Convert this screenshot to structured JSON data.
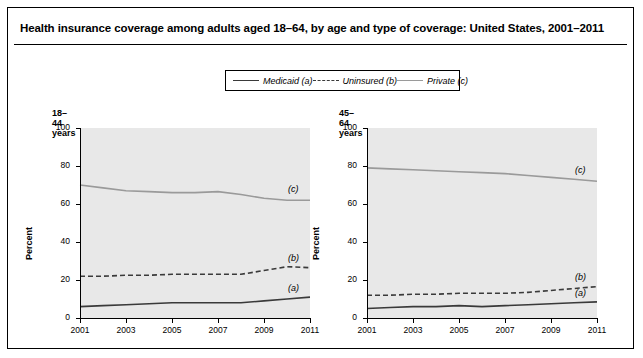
{
  "title": "Health insurance coverage among adults aged 18–64, by age and type of coverage: United States, 2001–2011",
  "legend": {
    "items": [
      {
        "label": "Medicaid (a)",
        "style": "solid-dark",
        "color": "#3a3a3a"
      },
      {
        "label": "Uninsured (b)",
        "style": "dashed-dark",
        "color": "#3a3a3a"
      },
      {
        "label": "Private (c)",
        "style": "solid-grey",
        "color": "#9a9a9a"
      }
    ]
  },
  "chart_data": [
    {
      "type": "line",
      "title": "18–44 years",
      "xlabel": "",
      "ylabel": "Percent",
      "x": [
        2001,
        2002,
        2003,
        2004,
        2005,
        2006,
        2007,
        2008,
        2009,
        2010,
        2011
      ],
      "xticks": [
        "2001",
        "2003",
        "2005",
        "2007",
        "2009",
        "2011"
      ],
      "yticks": [
        "0",
        "20",
        "40",
        "60",
        "80",
        "100"
      ],
      "ylim": [
        0,
        100
      ],
      "xlim": [
        2001,
        2011
      ],
      "grid": false,
      "legend_position": "top-center-shared",
      "series": [
        {
          "name": "Private (c)",
          "annotation": "(c)",
          "values": [
            70,
            68.5,
            67,
            66.5,
            66,
            66,
            66.5,
            65,
            63,
            62,
            62
          ]
        },
        {
          "name": "Uninsured (b)",
          "annotation": "(b)",
          "values": [
            22,
            22,
            22.5,
            22.5,
            23,
            23,
            23,
            23,
            25,
            27,
            26.5
          ]
        },
        {
          "name": "Medicaid (a)",
          "annotation": "(a)",
          "values": [
            6,
            6.5,
            7,
            7.5,
            8,
            8,
            8,
            8,
            9,
            10,
            11
          ]
        }
      ]
    },
    {
      "type": "line",
      "title": "45–64 years",
      "xlabel": "",
      "ylabel": "Percent",
      "x": [
        2001,
        2002,
        2003,
        2004,
        2005,
        2006,
        2007,
        2008,
        2009,
        2010,
        2011
      ],
      "xticks": [
        "2001",
        "2003",
        "2005",
        "2007",
        "2009",
        "2011"
      ],
      "yticks": [
        "0",
        "20",
        "40",
        "60",
        "80",
        "100"
      ],
      "ylim": [
        0,
        100
      ],
      "xlim": [
        2001,
        2011
      ],
      "grid": false,
      "legend_position": "top-center-shared",
      "series": [
        {
          "name": "Private (c)",
          "annotation": "(c)",
          "values": [
            79,
            78.5,
            78,
            77.5,
            77,
            76.5,
            76,
            75,
            74,
            73,
            72
          ]
        },
        {
          "name": "Uninsured (b)",
          "annotation": "(b)",
          "values": [
            12,
            12,
            12.5,
            12.5,
            13,
            13,
            13,
            13.5,
            14.5,
            15.5,
            16.5
          ]
        },
        {
          "name": "Medicaid (a)",
          "annotation": "(a)",
          "values": [
            5,
            5.5,
            6,
            6,
            6.5,
            6,
            6.5,
            7,
            7.5,
            8,
            8.5
          ]
        }
      ]
    }
  ]
}
